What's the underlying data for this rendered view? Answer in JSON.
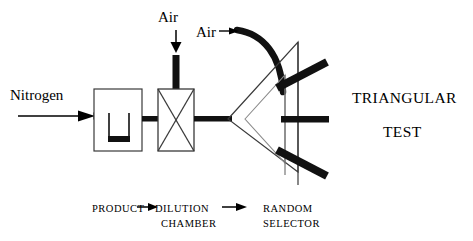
{
  "figure": {
    "title_lines": [
      "TRIANGULAR",
      "TEST"
    ],
    "background_color": "#ffffff",
    "line_color": "#000000",
    "thick_pipe_color": "#111111"
  },
  "labels": {
    "nitrogen": "Nitrogen",
    "air_chamber": "Air",
    "air_selector": "Air"
  },
  "caption": {
    "product": "PRODUCT",
    "dilution": "DILUTION",
    "chamber": "CHAMBER",
    "random": "RANDOM",
    "selector": "SELECTOR",
    "arrow_glyph": "→"
  },
  "components": [
    {
      "name": "nitrogen-inlet-arrow",
      "type": "thin-arrow",
      "direction": "right"
    },
    {
      "name": "product-vessel",
      "type": "box-with-u-container"
    },
    {
      "name": "dilution-chamber",
      "type": "box-with-x-cross"
    },
    {
      "name": "air-inlet-pipe",
      "type": "thick-vertical-pipe"
    },
    {
      "name": "random-selector",
      "type": "nested-triangles"
    },
    {
      "name": "selector-output-arm-upper",
      "type": "thick-arm",
      "angle": "up-right"
    },
    {
      "name": "selector-output-arm-middle",
      "type": "thick-arm",
      "angle": "horizontal"
    },
    {
      "name": "selector-output-arm-lower",
      "type": "thick-arm",
      "angle": "down-right"
    },
    {
      "name": "air-exhaust-curve",
      "type": "thick-arc"
    }
  ]
}
